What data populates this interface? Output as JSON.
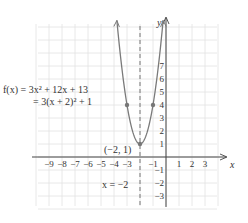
{
  "chart_data": {
    "type": "line",
    "title": "",
    "xlabel": "x",
    "ylabel": "y",
    "xlim": [
      -10,
      4
    ],
    "ylim": [
      -4,
      10
    ],
    "grid": true,
    "x_tick_labels": [
      "-9",
      "-8",
      "-7",
      "-6",
      "-5",
      "-4",
      "-3",
      "-1",
      "1",
      "2",
      "3"
    ],
    "x_ticks": [
      -9,
      -8,
      -7,
      -6,
      -5,
      -4,
      -3,
      -1,
      1,
      2,
      3
    ],
    "y_tick_labels": [
      "7",
      "6",
      "5",
      "4",
      "3",
      "2",
      "1",
      "-1",
      "-2",
      "-3"
    ],
    "y_ticks": [
      7,
      6,
      5,
      4,
      3,
      2,
      1,
      -1,
      -2,
      -3
    ],
    "series": [
      {
        "name": "f(x) = 3x^2 + 12x + 13",
        "function": "3x^2 + 12x + 13",
        "x_range": [
          -3.78,
          -0.22
        ],
        "color": "#7a7a7a"
      }
    ],
    "points": [
      {
        "x": -3,
        "y": 4
      },
      {
        "x": -2,
        "y": 1
      },
      {
        "x": -1,
        "y": 4
      }
    ],
    "annotations": {
      "equation_line1": "f(x) = 3x² + 12x + 13",
      "equation_line2": "= 3(x + 2)² + 1",
      "vertex_label": "(−2, 1)",
      "axis_of_symmetry_label": "x = −2",
      "axis_of_symmetry_x": -2
    }
  }
}
